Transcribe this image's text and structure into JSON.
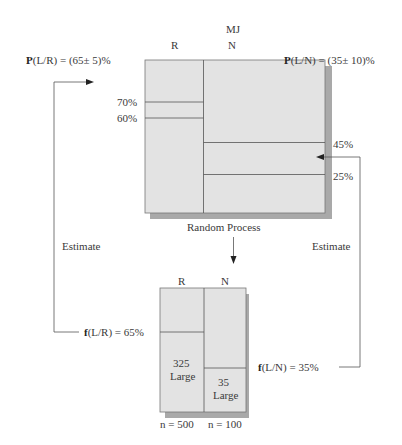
{
  "top_panel": {
    "title": "MJ",
    "col_left": "R",
    "col_right": "N",
    "caption": "Random Process",
    "left_labels": [
      "70%",
      "60%"
    ],
    "right_labels": [
      "45%",
      "25%"
    ],
    "prob_left_bold": "P",
    "prob_left_rest": "(L/R) = (65± 5)%",
    "prob_right_bold": "P",
    "prob_right_rest": "(L/N) = (35± 10)%"
  },
  "bottom_panel": {
    "col_left": "R",
    "col_right": "N",
    "left_count": "325",
    "left_count_label": "Large",
    "right_count": "35",
    "right_count_label": "Large",
    "n_left": "n = 500",
    "n_right": "n = 100",
    "freq_left_bold": "f",
    "freq_left_rest": "(L/R) = 65%",
    "freq_right_bold": "f",
    "freq_right_rest": "(L/N) = 35%"
  },
  "arrows": {
    "left_label": "Estimate",
    "right_label": "Estimate"
  },
  "colors": {
    "box_fill": "#e3e3e3",
    "shadow": "#a9a9a9",
    "line": "#555555"
  }
}
